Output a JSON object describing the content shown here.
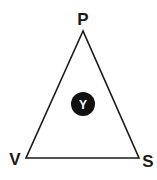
{
  "diagram": {
    "type": "triangle",
    "vertices": [
      {
        "label": "P",
        "position": "top"
      },
      {
        "label": "V",
        "position": "bottom-left"
      },
      {
        "label": "S",
        "position": "bottom-right"
      }
    ],
    "center_node": {
      "label": "Y",
      "fill": "#111111",
      "text_color": "#ffffff"
    },
    "stroke_color": "#1a1a1a"
  }
}
